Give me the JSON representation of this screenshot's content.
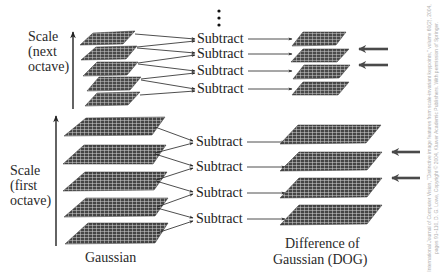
{
  "diagram": {
    "continuation_marker": "⋮",
    "octaves": [
      {
        "name": "next",
        "scale_label": [
          "Scale",
          "(next",
          "octave)"
        ],
        "gaussian_planes": 5,
        "subtract_labels": [
          "Subtract",
          "Subtract",
          "Subtract",
          "Subtract"
        ],
        "dog_planes": 4,
        "highlight_arrows": 2
      },
      {
        "name": "first",
        "scale_label": [
          "Scale",
          "(first",
          "octave)"
        ],
        "gaussian_planes": 5,
        "subtract_labels": [
          "Subtract",
          "Subtract",
          "Subtract",
          "Subtract"
        ],
        "dog_planes": 4,
        "highlight_arrows": 2
      }
    ],
    "column_labels": {
      "gaussian": "Gaussian",
      "dog_line1": "Difference of",
      "dog_line2": "Gaussian (DOG)"
    },
    "credit": "International Journal of Computer Vision, \"Distinctive image features from scale-invariant keypoints,\" volume 60(2), 2004, pages 91–110, D. G. Lowe, Copyright © 2004, Kluwer Academic Publishers. With permission of Springer."
  },
  "colors": {
    "plane_fill": "#4a4a4a",
    "plane_grid": "#cfcfcf",
    "arrow": "#222222",
    "highlight_arrow": "#4a4a4a",
    "text": "#2a2a2a",
    "credit": "#b0b0b0"
  }
}
